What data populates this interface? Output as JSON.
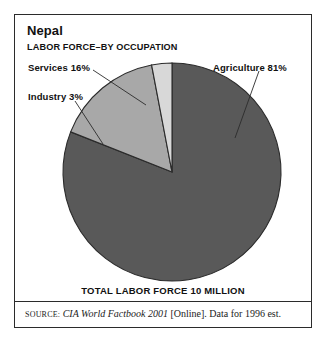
{
  "figure": {
    "title": "Nepal",
    "subtitle": "LABOR FORCE–BY OCCUPATION",
    "total_label": "TOTAL LABOR FORCE 10 MILLION",
    "source": {
      "prefix": "SOURCE:",
      "publication": "CIA World Factbook 2001",
      "suffix": "[Online]. Data for 1996 est."
    },
    "frame_color": "#2b2b2b",
    "background": "#ffffff"
  },
  "chart_data": {
    "type": "pie",
    "title": "Nepal",
    "subtitle": "LABOR FORCE–BY OCCUPATION",
    "unit": "percent",
    "total_note": "TOTAL LABOR FORCE 10 MILLION",
    "categories": [
      "Agriculture",
      "Services",
      "Industry"
    ],
    "values": [
      81,
      16,
      3
    ],
    "labels": [
      "Agriculture 81%",
      "Services 16%",
      "Industry 3%"
    ],
    "colors": [
      "#595959",
      "#a8a8a8",
      "#d8d8d8"
    ],
    "start_angle_deg": 0,
    "direction": "clockwise",
    "legend": "none",
    "grid": false,
    "slices": [
      {
        "name": "Agriculture",
        "value": 81,
        "label": "Agriculture 81%",
        "color": "#595959",
        "start_deg": 0,
        "end_deg": 291.6
      },
      {
        "name": "Services",
        "value": 16,
        "label": "Services 16%",
        "color": "#a8a8a8",
        "start_deg": 291.6,
        "end_deg": 349.2
      },
      {
        "name": "Industry",
        "value": 3,
        "label": "Industry 3%",
        "color": "#d8d8d8",
        "start_deg": 349.2,
        "end_deg": 360
      }
    ]
  }
}
